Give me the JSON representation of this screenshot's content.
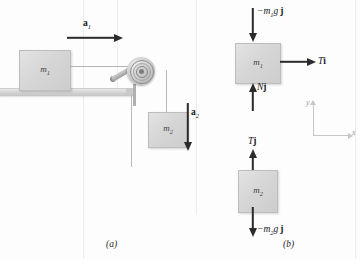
{
  "figure": {
    "caption_a": "(a)",
    "caption_b": "(b)",
    "background_color": "#fdfdfd",
    "block_color": "#d6d6d6",
    "arrow_color": "#2b2b2b",
    "axis_color": "#c6c6c6"
  },
  "panel_a": {
    "name": "pulley-system-physical-setup",
    "block1_label": "m",
    "block1_sub": "1",
    "block2_label": "m",
    "block2_sub": "2",
    "accel1_label": "a",
    "accel1_sub": "1",
    "accel2_label": "a",
    "accel2_sub": "2",
    "pulley_name": "pulley",
    "surface_name": "table-surface",
    "string_name": "connecting-string"
  },
  "panel_b": {
    "name": "free-body-diagrams",
    "fbd1": {
      "block_label": "m",
      "block_sub": "1",
      "force_weight": "−m",
      "force_weight_sub": "1",
      "force_weight_tail": "g",
      "force_weight_unit": "j",
      "force_tension": "T",
      "force_tension_unit": "i",
      "force_normal": "N",
      "force_normal_unit": "j"
    },
    "fbd2": {
      "block_label": "m",
      "block_sub": "2",
      "force_tension": "T",
      "force_tension_unit": "j",
      "force_weight": "−m",
      "force_weight_sub": "2",
      "force_weight_tail": "g",
      "force_weight_unit": "j"
    },
    "axes": {
      "y_label": "y",
      "x_label": "x"
    }
  }
}
